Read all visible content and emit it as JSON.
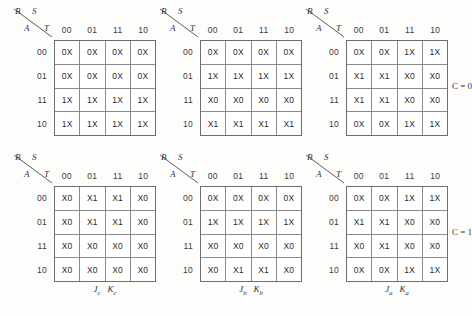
{
  "figure": {
    "header": {
      "top_left_var": "B",
      "top_right_var": "S",
      "bottom_left_var": "A",
      "bottom_right_var": "T"
    },
    "column_headers": [
      "00",
      "01",
      "11",
      "10"
    ],
    "row_headers": [
      "00",
      "01",
      "11",
      "10"
    ],
    "side_labels": {
      "row0": "C = 0",
      "row1": "C = 1"
    }
  },
  "maps": [
    {
      "id": "jc-kc-c0",
      "position": "top-left",
      "output_label": {
        "j": "J",
        "j_sub": "c",
        "k": "K",
        "k_sub": "c"
      },
      "show_output_label": false,
      "side_label": "",
      "rows": [
        [
          "0X",
          "0X",
          "0X",
          "0X"
        ],
        [
          "0X",
          "0X",
          "0X",
          "0X"
        ],
        [
          "1X",
          "1X",
          "1X",
          "1X"
        ],
        [
          "1X",
          "1X",
          "1X",
          "1X"
        ]
      ]
    },
    {
      "id": "jb-kb-c0",
      "position": "top-middle",
      "output_label": {
        "j": "J",
        "j_sub": "b",
        "k": "K",
        "k_sub": "b"
      },
      "show_output_label": false,
      "side_label": "",
      "rows": [
        [
          "0X",
          "0X",
          "0X",
          "0X"
        ],
        [
          "1X",
          "1X",
          "1X",
          "1X"
        ],
        [
          "X0",
          "X0",
          "X0",
          "X0"
        ],
        [
          "X1",
          "X1",
          "X1",
          "X1"
        ]
      ]
    },
    {
      "id": "ja-ka-c0",
      "position": "top-right",
      "output_label": {
        "j": "J",
        "j_sub": "a",
        "k": "K",
        "k_sub": "a"
      },
      "show_output_label": false,
      "side_label": "C = 0",
      "rows": [
        [
          "0X",
          "0X",
          "1X",
          "1X"
        ],
        [
          "X1",
          "X1",
          "X0",
          "X0"
        ],
        [
          "X1",
          "X1",
          "X0",
          "X0"
        ],
        [
          "0X",
          "0X",
          "1X",
          "1X"
        ]
      ]
    },
    {
      "id": "jc-kc-c1",
      "position": "bottom-left",
      "output_label": {
        "j": "J",
        "j_sub": "c",
        "k": "K",
        "k_sub": "c"
      },
      "show_output_label": true,
      "side_label": "",
      "rows": [
        [
          "X0",
          "X1",
          "X1",
          "X0"
        ],
        [
          "X0",
          "X1",
          "X1",
          "X0"
        ],
        [
          "X0",
          "X0",
          "X0",
          "X0"
        ],
        [
          "X0",
          "X0",
          "X0",
          "X0"
        ]
      ]
    },
    {
      "id": "jb-kb-c1",
      "position": "bottom-middle",
      "output_label": {
        "j": "J",
        "j_sub": "b",
        "k": "K",
        "k_sub": "b"
      },
      "show_output_label": true,
      "side_label": "",
      "rows": [
        [
          "0X",
          "0X",
          "0X",
          "0X"
        ],
        [
          "1X",
          "1X",
          "1X",
          "1X"
        ],
        [
          "X0",
          "X0",
          "X0",
          "X0"
        ],
        [
          "X0",
          "X1",
          "X1",
          "X0"
        ]
      ]
    },
    {
      "id": "ja-ka-c1",
      "position": "bottom-right",
      "output_label": {
        "j": "J",
        "j_sub": "a",
        "k": "K",
        "k_sub": "a"
      },
      "show_output_label": true,
      "side_label": "C = 1",
      "rows": [
        [
          "0X",
          "0X",
          "1X",
          "1X"
        ],
        [
          "X1",
          "X1",
          "X0",
          "X0"
        ],
        [
          "X0",
          "X1",
          "X0",
          "X0"
        ],
        [
          "0X",
          "0X",
          "1X",
          "1X"
        ]
      ]
    }
  ]
}
